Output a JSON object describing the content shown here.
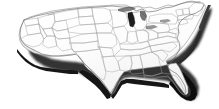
{
  "image": {
    "title": "United States map",
    "subject": "Contiguous United States with state boundaries",
    "style": "3D extruded relief map, white surface with gray outlines",
    "width": 219,
    "height": 109,
    "caption": ""
  },
  "colors": {
    "background": "#ffffff",
    "land_fill": "#fdfdfd",
    "state_border": "#9a9a9a",
    "coastline": "#6d6d6d",
    "extrusion_shadow": "#141414",
    "extrusion_shadow_mid": "#4a4a4a",
    "lake_michigan": "#1e1e1e",
    "soft_shadow": "#cfcfcf"
  },
  "features": [
    {
      "name": "lake-michigan",
      "label": "Lake Michigan",
      "kind": "water"
    },
    {
      "name": "florida-peninsula",
      "label": "Florida",
      "kind": "land"
    },
    {
      "name": "texas",
      "label": "Texas",
      "kind": "land"
    },
    {
      "name": "maine",
      "label": "Maine",
      "kind": "land"
    },
    {
      "name": "california-coast",
      "label": "California",
      "kind": "land"
    },
    {
      "name": "gulf-coast",
      "label": "Gulf Coast",
      "kind": "coast"
    },
    {
      "name": "atlantic-coast",
      "label": "Atlantic Coast",
      "kind": "coast"
    },
    {
      "name": "pacific-coast",
      "label": "Pacific Coast",
      "kind": "coast"
    },
    {
      "name": "canadian-border",
      "label": "Northern Border",
      "kind": "border"
    }
  ],
  "regions": {
    "west": [
      "Washington",
      "Oregon",
      "California",
      "Idaho",
      "Nevada",
      "Utah",
      "Arizona",
      "Montana",
      "Wyoming",
      "Colorado",
      "New Mexico"
    ],
    "plains": [
      "North Dakota",
      "South Dakota",
      "Nebraska",
      "Kansas",
      "Oklahoma",
      "Texas",
      "Minnesota",
      "Iowa",
      "Missouri",
      "Arkansas",
      "Louisiana"
    ],
    "midwest": [
      "Wisconsin",
      "Michigan",
      "Illinois",
      "Indiana",
      "Ohio",
      "Kentucky",
      "Tennessee"
    ],
    "south": [
      "Mississippi",
      "Alabama",
      "Georgia",
      "Florida",
      "South Carolina",
      "North Carolina"
    ],
    "northeast": [
      "Virginia",
      "West Virginia",
      "Maryland",
      "Delaware",
      "Pennsylvania",
      "New Jersey",
      "New York",
      "Connecticut",
      "Rhode Island",
      "Massachusetts",
      "Vermont",
      "New Hampshire",
      "Maine"
    ]
  }
}
